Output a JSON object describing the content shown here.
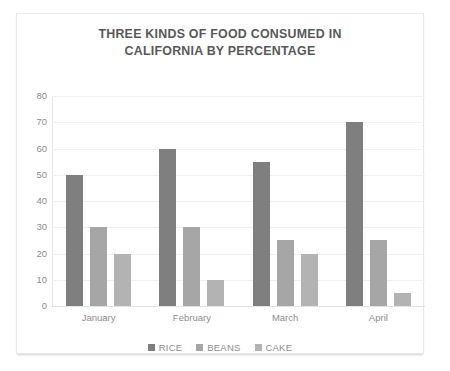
{
  "chart_data": {
    "type": "bar",
    "title": "THREE KINDS OF FOOD CONSUMED IN CALIFORNIA BY PERCENTAGE",
    "title_line1": "THREE KINDS OF FOOD CONSUMED IN",
    "title_line2": "CALIFORNIA BY PERCENTAGE",
    "categories": [
      "January",
      "February",
      "March",
      "April"
    ],
    "series": [
      {
        "name": "RICE",
        "values": [
          50,
          60,
          55,
          70
        ],
        "color": "#7f7f7f"
      },
      {
        "name": "BEANS",
        "values": [
          30,
          30,
          25,
          25
        ],
        "color": "#a6a6a6"
      },
      {
        "name": "CAKE",
        "values": [
          20,
          10,
          20,
          5
        ],
        "color": "#b3b3b3"
      }
    ],
    "xlabel": "",
    "ylabel": "",
    "ylim": [
      0,
      80
    ],
    "ytick_labels": [
      "80",
      "70",
      "60",
      "50",
      "40",
      "30",
      "20",
      "10",
      "0"
    ],
    "ytick_values": [
      80,
      70,
      60,
      50,
      40,
      30,
      20,
      10,
      0
    ],
    "grid": true,
    "legend_position": "bottom",
    "background_color": "#ffffff",
    "grid_color": "#f0f0f0",
    "axis_text_color": "#8d8d8d",
    "title_color": "#585858"
  }
}
